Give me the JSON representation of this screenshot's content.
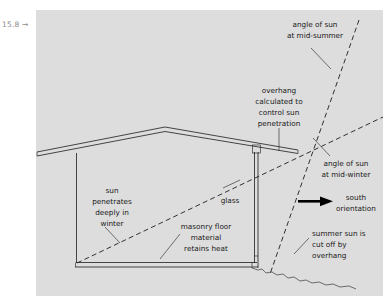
{
  "figure": {
    "margin_label": "15.8 →",
    "panel_color": "#dddddd",
    "page_background": "#ffffff",
    "ink_color": "#1d1d1d",
    "title_implicit": "Passive solar house section: sun angles and overhang"
  },
  "annotations": {
    "mid_summer": {
      "name": "angle-of-sun-at-mid-summer",
      "lines": [
        "angle of sun",
        "at mid-summer"
      ],
      "align": "center"
    },
    "overhang": {
      "name": "overhang-calculated-to-control-sun-penetration",
      "lines": [
        "overhang",
        "calculated to",
        "control sun",
        "penetration"
      ],
      "align": "center"
    },
    "mid_winter": {
      "name": "angle-of-sun-at-mid-winter",
      "lines": [
        "angle of sun",
        "at mid-winter"
      ],
      "align": "center"
    },
    "south": {
      "name": "south-orientation",
      "lines": [
        "south",
        "orientation"
      ],
      "align": "center"
    },
    "summer_cutoff": {
      "name": "summer-sun-is-cut-off-by-overhang",
      "lines": [
        "summer sun is",
        "cut off by",
        "overhang"
      ],
      "align": "left"
    },
    "winter_penetration": {
      "name": "sun-penetrates-deeply-in-winter",
      "lines": [
        "sun",
        "penetrates",
        "deeply in",
        "winter"
      ],
      "align": "center"
    },
    "masonry": {
      "name": "masonry-floor-material-retains-heat",
      "lines": [
        "masonry floor",
        "material",
        "retains heat"
      ],
      "align": "center"
    },
    "glass": {
      "name": "glass",
      "lines": [
        "glass"
      ],
      "align": "center"
    }
  },
  "geometry_notes": {
    "roof_ridge_x": 165,
    "roof_ridge_y": 127,
    "left_eave_x": 36,
    "right_eave_x": 298,
    "convergence_x": 298,
    "convergence_y": 150,
    "left_wall_x": 76,
    "glass_wall_x": 256,
    "floor_y": 263
  }
}
